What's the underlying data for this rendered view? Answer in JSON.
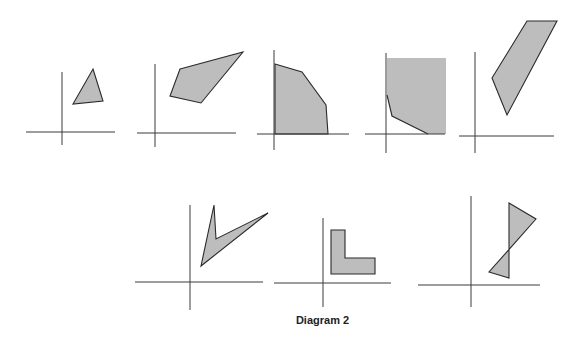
{
  "caption": "Diagram 2",
  "colors": {
    "fill": "#bdbdbd",
    "stroke": "#2a2a2a",
    "axis": "#3a3a3a"
  },
  "panels": [
    {
      "name": "triangle",
      "axes": {
        "x": 62,
        "y": 132,
        "h": [
          26,
          115
        ],
        "v": [
          72,
          145
        ]
      },
      "points": "93,69 103,101 73,104"
    },
    {
      "name": "quadrilateral",
      "axes": {
        "x": 155,
        "y": 133,
        "h": [
          137,
          236
        ],
        "v": [
          64,
          147
        ]
      },
      "points": "180,69 243,52 201,103 170,96"
    },
    {
      "name": "region-on-axes",
      "axes": {
        "x": 274,
        "y": 134,
        "h": [
          257,
          349
        ],
        "v": [
          50,
          150
        ]
      },
      "points": "275,64 302,72 326,105 328,134 275,134"
    },
    {
      "name": "unbounded-region",
      "axes": {
        "x": 386,
        "y": 134,
        "h": [
          365,
          445
        ],
        "v": [
          53,
          153
        ]
      },
      "points": "387,58 446,58 446,134 428,134 392,116 387,95",
      "openStroke": "387,95 392,116 428,134"
    },
    {
      "name": "strip",
      "axes": {
        "x": 475,
        "y": 136,
        "h": [
          459,
          554
        ],
        "v": [
          52,
          153
        ]
      },
      "points": "527,21 557,21 507,115 492,78"
    },
    {
      "name": "chevron",
      "axes": {
        "x": 190,
        "y": 282,
        "h": [
          135,
          263
        ],
        "v": [
          205,
          310
        ]
      },
      "points": "201,266 214,205 216,239 268,213"
    },
    {
      "name": "l-shape",
      "axes": {
        "x": 323,
        "y": 283,
        "h": [
          274,
          391
        ],
        "v": [
          218,
          307
        ]
      },
      "points": "331,230 345,230 345,258 375,258 375,274 331,274"
    },
    {
      "name": "bowtie",
      "axes": {
        "x": 471,
        "y": 285,
        "h": [
          418,
          540
        ],
        "v": [
          196,
          307
        ]
      },
      "points": "509,203 536,219 489,272 509,278"
    }
  ]
}
